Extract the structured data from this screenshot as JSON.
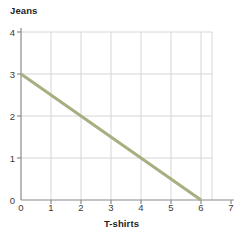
{
  "chart_data": {
    "type": "line",
    "title": "",
    "xlabel": "T-shirts",
    "ylabel": "Jeans",
    "xlim": [
      0,
      7
    ],
    "ylim": [
      0,
      4
    ],
    "xticks": [
      "0",
      "1",
      "2",
      "3",
      "4",
      "5",
      "6",
      "7"
    ],
    "yticks": [
      "0",
      "1",
      "2",
      "3",
      "4"
    ],
    "xtick_values": [
      0,
      1,
      2,
      3,
      4,
      5,
      6,
      7
    ],
    "ytick_values": [
      0,
      1,
      2,
      3,
      4
    ],
    "grid": true,
    "legend": null,
    "line_color": "#a9ae80",
    "grid_color": "#d6d6d6",
    "axis_color": "#8a8a8a",
    "background_color": "#ffffff",
    "series": [
      {
        "name": "Budget constraint",
        "color": "#a9ae80",
        "x": [
          0,
          6
        ],
        "y": [
          3,
          0
        ],
        "points": [
          {
            "x": 0,
            "y": 3
          },
          {
            "x": 1,
            "y": 2.5
          },
          {
            "x": 2,
            "y": 2
          },
          {
            "x": 3,
            "y": 1.5
          },
          {
            "x": 4,
            "y": 1
          },
          {
            "x": 5,
            "y": 0.5
          },
          {
            "x": 6,
            "y": 0
          }
        ],
        "slope": -0.5,
        "intercept": 3
      }
    ]
  },
  "axes": {
    "y_title": "Jeans",
    "x_title": "T-shirts"
  }
}
